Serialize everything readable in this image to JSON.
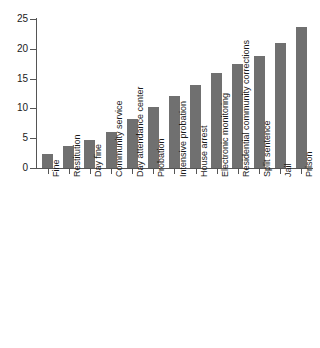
{
  "chart_data": {
    "type": "bar",
    "title": "",
    "subtitle": "",
    "xlabel": "",
    "ylabel": "",
    "categories": [
      "Fine",
      "Restitution",
      "Day fine",
      "Community service",
      "Day attendance center",
      "Probation",
      "Intensive probation",
      "House arrest",
      "Electronic monitoring",
      "Residential community corrections",
      "Split sentence",
      "Jail",
      "Prison"
    ],
    "values": [
      2.4,
      3.7,
      4.7,
      6.1,
      8.2,
      10.2,
      12.0,
      14.0,
      15.9,
      17.5,
      18.8,
      21.0,
      23.7
    ],
    "ylim": [
      0,
      25
    ],
    "yticks": [
      0,
      5,
      10,
      15,
      20,
      25
    ],
    "ytick_labels": [
      "0",
      "5",
      "10",
      "15",
      "20",
      "25"
    ],
    "grid": false,
    "legend": null,
    "bar_color": "#707070",
    "axis_color": "#555555",
    "background": "#ffffff"
  }
}
